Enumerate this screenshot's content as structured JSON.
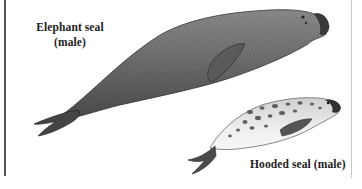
{
  "figure": {
    "labels": {
      "elephant_seal_line1": "Elephant seal",
      "elephant_seal_line2": "(male)",
      "hooded_seal": "Hooded seal (male)"
    },
    "animals": [
      {
        "name": "Elephant seal",
        "sex": "male",
        "rendering": "gray engraving"
      },
      {
        "name": "Hooded seal",
        "sex": "male",
        "rendering": "spotted engraving"
      }
    ],
    "colors": {
      "ink": "#2a2a2a",
      "elephant_body": "#6f6f6f",
      "hooded_body": "#e4e4e4",
      "spots": "#4a4a4a",
      "frame_left": "#555555",
      "frame_right": "#c8c8c8"
    }
  }
}
